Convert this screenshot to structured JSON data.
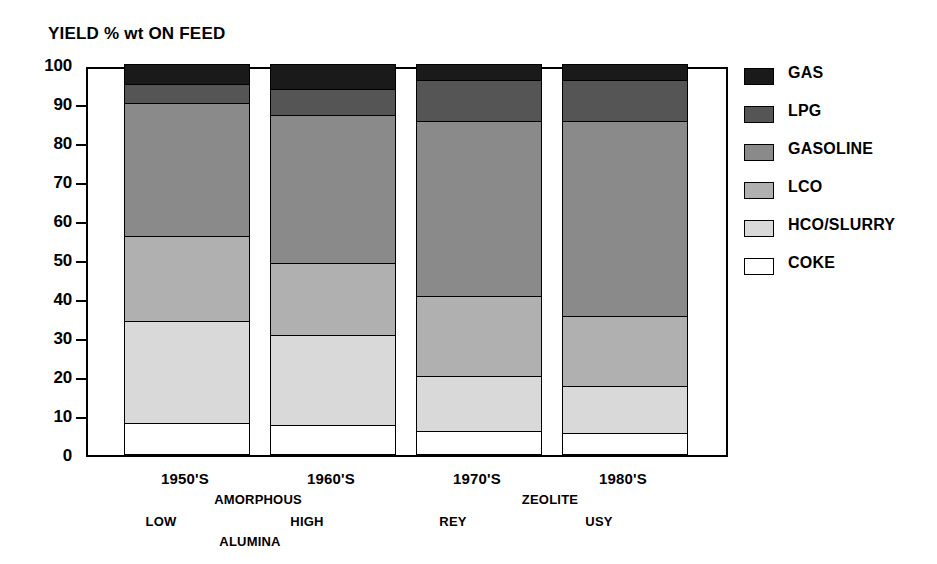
{
  "chart_data": {
    "type": "bar",
    "subtype": "stacked-bar",
    "title": "YIELD % wt ON FEED",
    "xlabel": "",
    "ylabel": "",
    "ylim": [
      0,
      100
    ],
    "yticks": [
      0,
      10,
      20,
      30,
      40,
      50,
      60,
      70,
      80,
      90,
      100
    ],
    "ytick_labels": [
      "0",
      "10",
      "20",
      "30",
      "40",
      "50",
      "60",
      "70",
      "80",
      "90",
      "100"
    ],
    "grid": false,
    "legend_position": "right",
    "categories": [
      "1950'S",
      "1960'S",
      "1970'S",
      "1980'S"
    ],
    "stack_order_bottom_to_top": [
      "COKE",
      "HCO/SLURRY",
      "LCO",
      "GASOLINE",
      "LPG",
      "GAS"
    ],
    "series": [
      {
        "name": "COKE",
        "color": "#ffffff",
        "values": [
          8.0,
          7.5,
          6.0,
          5.5
        ]
      },
      {
        "name": "HCO/SLURRY",
        "color": "#d9d9d9",
        "values": [
          26.0,
          23.0,
          14.0,
          12.0
        ]
      },
      {
        "name": "LCO",
        "color": "#b0b0b0",
        "values": [
          22.0,
          18.5,
          20.5,
          18.0
        ]
      },
      {
        "name": "GASOLINE",
        "color": "#8a8a8a",
        "values": [
          34.0,
          38.0,
          45.0,
          50.0
        ]
      },
      {
        "name": "LPG",
        "color": "#555555",
        "values": [
          5.0,
          6.5,
          10.5,
          10.5
        ]
      },
      {
        "name": "GAS",
        "color": "#1a1a1a",
        "values": [
          5.0,
          6.5,
          4.0,
          4.0
        ]
      }
    ],
    "cumulative_tops": {
      "1950'S": {
        "COKE": 8.0,
        "HCO/SLURRY": 34.0,
        "LCO": 56.0,
        "GASOLINE": 90.0,
        "LPG": 95.0,
        "GAS": 100.0
      },
      "1960'S": {
        "COKE": 7.5,
        "HCO/SLURRY": 30.5,
        "LCO": 49.0,
        "GASOLINE": 87.0,
        "LPG": 93.5,
        "GAS": 100.0
      },
      "1970'S": {
        "COKE": 6.0,
        "HCO/SLURRY": 20.0,
        "LCO": 40.5,
        "GASOLINE": 85.5,
        "LPG": 96.0,
        "GAS": 100.0
      },
      "1980'S": {
        "COKE": 5.5,
        "HCO/SLURRY": 17.5,
        "LCO": 35.5,
        "GASOLINE": 85.5,
        "LPG": 96.0,
        "GAS": 100.0
      }
    },
    "group_annotations": [
      {
        "label": "AMORPHOUS",
        "spans": [
          "1950'S",
          "1960'S"
        ]
      },
      {
        "label": "ALUMINA",
        "spans": [
          "1950'S",
          "1960'S"
        ]
      },
      {
        "label": "ZEOLITE",
        "spans": [
          "1970'S",
          "1980'S"
        ]
      }
    ],
    "catalyst_labels": [
      "LOW",
      "HIGH",
      "REY",
      "USY"
    ]
  },
  "title": "YIELD % wt ON FEED",
  "yaxis": {
    "ticks": [
      {
        "label": "100",
        "value": 100
      },
      {
        "label": "90",
        "value": 90
      },
      {
        "label": "80",
        "value": 80
      },
      {
        "label": "70",
        "value": 70
      },
      {
        "label": "60",
        "value": 60
      },
      {
        "label": "50",
        "value": 50
      },
      {
        "label": "40",
        "value": 40
      },
      {
        "label": "30",
        "value": 30
      },
      {
        "label": "20",
        "value": 20
      },
      {
        "label": "10",
        "value": 10
      },
      {
        "label": "0",
        "value": 0
      }
    ]
  },
  "xaxis": {
    "decades": [
      "1950'S",
      "1960'S",
      "1970'S",
      "1980'S"
    ],
    "catalysts": [
      "LOW",
      "HIGH",
      "REY",
      "USY"
    ],
    "groups": [
      "AMORPHOUS",
      "ZEOLITE"
    ],
    "alumina_label": "ALUMINA"
  },
  "legend": {
    "items": [
      {
        "label": "GAS",
        "color": "#1a1a1a"
      },
      {
        "label": "LPG",
        "color": "#555555"
      },
      {
        "label": "GASOLINE",
        "color": "#8a8a8a"
      },
      {
        "label": "LCO",
        "color": "#b0b0b0"
      },
      {
        "label": "HCO/SLURRY",
        "color": "#d9d9d9"
      },
      {
        "label": "COKE",
        "color": "#ffffff"
      }
    ]
  }
}
